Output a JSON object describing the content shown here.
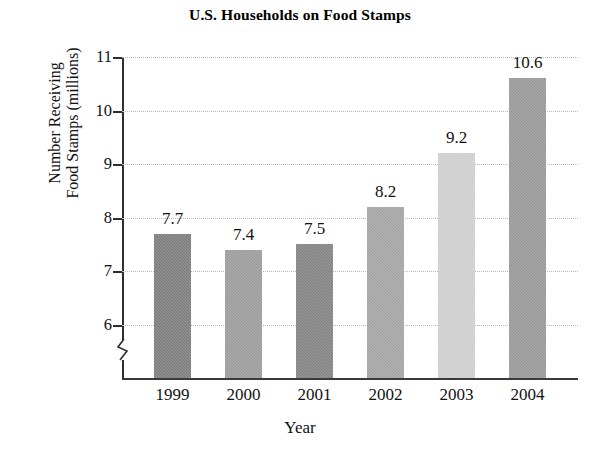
{
  "chart_data": {
    "type": "bar",
    "title": "U.S. Households on Food Stamps",
    "xlabel": "Year",
    "ylabel": "Number Receiving Food Stamps (millions)",
    "ylabel_lines": [
      "Number Receiving",
      "Food Stamps (millions)"
    ],
    "categories": [
      "1999",
      "2000",
      "2001",
      "2002",
      "2003",
      "2004"
    ],
    "values": [
      7.7,
      7.4,
      7.5,
      8.2,
      9.2,
      10.6
    ],
    "value_labels": [
      "7.7",
      "7.4",
      "7.5",
      "8.2",
      "9.2",
      "10.6"
    ],
    "ylim": [
      5.6,
      11
    ],
    "ytick_labels": [
      "6",
      "7",
      "8",
      "9",
      "10",
      "11"
    ],
    "ytick_values": [
      6,
      7,
      8,
      9,
      10,
      11
    ],
    "grid": true,
    "grid_style": "dotted",
    "grid_color": "#b9b9b9",
    "legend": null,
    "axis_break": true,
    "axis_break_note": "y-axis broken below 6",
    "bar_colors": [
      "#787878",
      "#989898",
      "#7e7e7e",
      "#a0a0a0",
      "#cdcdcd",
      "#949494"
    ],
    "axis_color": "#2e2e2e",
    "background_color": "#ffffff"
  }
}
